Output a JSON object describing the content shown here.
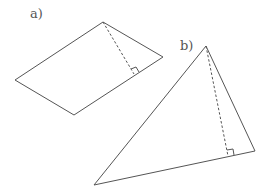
{
  "figures": [
    {
      "label": "a)",
      "shape": "parallelogram",
      "height_marked": true
    },
    {
      "label": "b)",
      "shape": "triangle",
      "height_marked": true
    }
  ],
  "colors": {
    "stroke": "#555555",
    "background": "#ffffff"
  }
}
